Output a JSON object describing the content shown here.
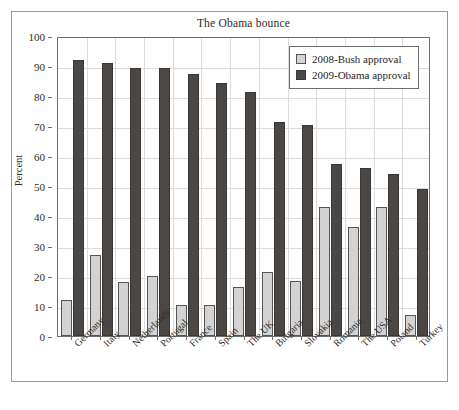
{
  "chart_data": {
    "type": "bar",
    "title": "The Obama bounce",
    "xlabel": "",
    "ylabel": "Percent",
    "ylim": [
      0,
      100
    ],
    "ytick_step": 10,
    "yticks": [
      0,
      10,
      20,
      30,
      40,
      50,
      60,
      70,
      80,
      90,
      100
    ],
    "grid": true,
    "legend_position": "top-right",
    "categories": [
      "Germany",
      "Italy",
      "Netherlands",
      "Portugal",
      "France",
      "Spain",
      "The UK",
      "Bulgaria",
      "Slovakia",
      "Romania",
      "The USA",
      "Poland",
      "Turkey"
    ],
    "series": [
      {
        "name": "2008-Bush approval",
        "color": "#d3d3d3",
        "values": [
          12,
          27,
          18,
          20,
          10.5,
          10.5,
          16.5,
          21.5,
          18.5,
          43,
          36.5,
          43,
          7
        ]
      },
      {
        "name": "2009-Obama approval",
        "color": "#4a4744",
        "values": [
          92,
          91,
          89.5,
          89.5,
          87.5,
          84.5,
          81.5,
          71.5,
          70.5,
          57.5,
          56,
          54,
          49
        ]
      }
    ]
  },
  "legend": {
    "items": [
      {
        "label": "2008-Bush approval",
        "swatch": "bush"
      },
      {
        "label": "2009-Obama approval",
        "swatch": "obama"
      }
    ]
  }
}
